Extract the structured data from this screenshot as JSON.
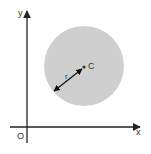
{
  "diagram": {
    "axes": {
      "x_label": "x",
      "y_label": "y",
      "origin_label": "O"
    },
    "circle": {
      "center_label": "C",
      "radius_label": "r",
      "fill_color": "#cfcfcf"
    },
    "colors": {
      "axis": "#222222",
      "text": "#333333",
      "background": "#ffffff"
    }
  }
}
